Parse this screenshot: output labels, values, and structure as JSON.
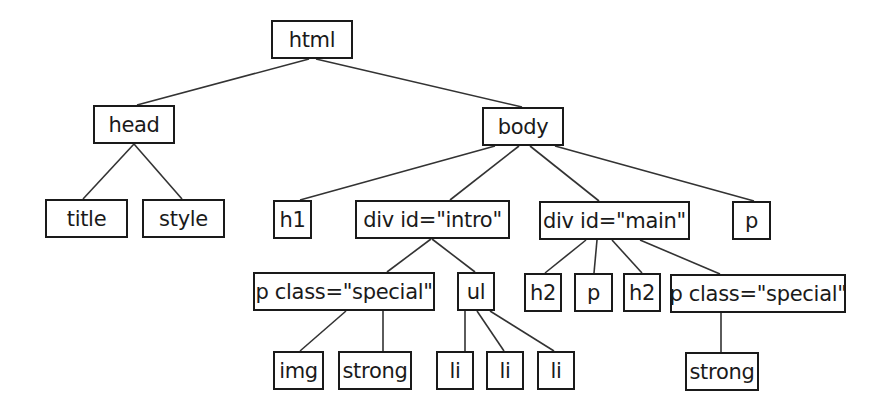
{
  "diagram": {
    "type": "dom-tree",
    "colors": {
      "box_border": "#1a1a1a",
      "edge": "#333333",
      "text": "#1a1a1a",
      "background": "#ffffff"
    },
    "nodes": [
      {
        "id": "html",
        "label": "html",
        "x": 271,
        "y": 20,
        "w": 82,
        "h": 39
      },
      {
        "id": "head",
        "label": "head",
        "x": 93,
        "y": 105,
        "w": 82,
        "h": 39
      },
      {
        "id": "body",
        "label": "body",
        "x": 482,
        "y": 107,
        "w": 82,
        "h": 39
      },
      {
        "id": "title",
        "label": "title",
        "x": 45,
        "y": 199,
        "w": 83,
        "h": 39
      },
      {
        "id": "style",
        "label": "style",
        "x": 142,
        "y": 199,
        "w": 83,
        "h": 39
      },
      {
        "id": "h1",
        "label": "h1",
        "x": 273,
        "y": 200,
        "w": 39,
        "h": 39
      },
      {
        "id": "divintro",
        "label": "div id=\"intro\"",
        "x": 355,
        "y": 200,
        "w": 155,
        "h": 39
      },
      {
        "id": "divmain",
        "label": "div id=\"main\"",
        "x": 539,
        "y": 201,
        "w": 151,
        "h": 39
      },
      {
        "id": "p_top",
        "label": "p",
        "x": 732,
        "y": 201,
        "w": 39,
        "h": 39
      },
      {
        "id": "pspecial1",
        "label": "p class=\"special\"",
        "x": 253,
        "y": 272,
        "w": 182,
        "h": 39
      },
      {
        "id": "ul",
        "label": "ul",
        "x": 457,
        "y": 272,
        "w": 38,
        "h": 39
      },
      {
        "id": "h2a",
        "label": "h2",
        "x": 524,
        "y": 273,
        "w": 38,
        "h": 39
      },
      {
        "id": "p_main",
        "label": "p",
        "x": 574,
        "y": 273,
        "w": 39,
        "h": 39
      },
      {
        "id": "h2b",
        "label": "h2",
        "x": 623,
        "y": 273,
        "w": 38,
        "h": 39
      },
      {
        "id": "pspecial2",
        "label": "p class=\"special\"",
        "x": 670,
        "y": 274,
        "w": 176,
        "h": 39
      },
      {
        "id": "img",
        "label": "img",
        "x": 273,
        "y": 351,
        "w": 51,
        "h": 39
      },
      {
        "id": "strong1",
        "label": "strong",
        "x": 338,
        "y": 351,
        "w": 74,
        "h": 39
      },
      {
        "id": "li1",
        "label": "li",
        "x": 436,
        "y": 351,
        "w": 38,
        "h": 39
      },
      {
        "id": "li2",
        "label": "li",
        "x": 486,
        "y": 351,
        "w": 38,
        "h": 39
      },
      {
        "id": "li3",
        "label": "li",
        "x": 537,
        "y": 351,
        "w": 38,
        "h": 39
      },
      {
        "id": "strong2",
        "label": "strong",
        "x": 685,
        "y": 352,
        "w": 74,
        "h": 39
      }
    ],
    "edges": [
      {
        "from": "html",
        "to": "head",
        "x1": 309,
        "y1": 59,
        "x2": 137,
        "y2": 105
      },
      {
        "from": "html",
        "to": "body",
        "x1": 316,
        "y1": 59,
        "x2": 522,
        "y2": 107
      },
      {
        "from": "head",
        "to": "title",
        "x1": 134,
        "y1": 144,
        "x2": 83,
        "y2": 199
      },
      {
        "from": "head",
        "to": "style",
        "x1": 134,
        "y1": 144,
        "x2": 182,
        "y2": 199
      },
      {
        "from": "body",
        "to": "h1",
        "x1": 495,
        "y1": 146,
        "x2": 300,
        "y2": 200
      },
      {
        "from": "body",
        "to": "divintro",
        "x1": 519,
        "y1": 146,
        "x2": 450,
        "y2": 200
      },
      {
        "from": "body",
        "to": "divmain",
        "x1": 530,
        "y1": 146,
        "x2": 599,
        "y2": 201
      },
      {
        "from": "body",
        "to": "p_top",
        "x1": 555,
        "y1": 146,
        "x2": 754,
        "y2": 201
      },
      {
        "from": "divintro",
        "to": "pspecial1",
        "x1": 431,
        "y1": 239,
        "x2": 387,
        "y2": 272
      },
      {
        "from": "divintro",
        "to": "ul",
        "x1": 432,
        "y1": 239,
        "x2": 475,
        "y2": 272
      },
      {
        "from": "pspecial1",
        "to": "img",
        "x1": 346,
        "y1": 311,
        "x2": 300,
        "y2": 351
      },
      {
        "from": "pspecial1",
        "to": "strong1",
        "x1": 383,
        "y1": 311,
        "x2": 383,
        "y2": 351
      },
      {
        "from": "ul",
        "to": "li1",
        "x1": 465,
        "y1": 311,
        "x2": 465,
        "y2": 351
      },
      {
        "from": "ul",
        "to": "li2",
        "x1": 477,
        "y1": 311,
        "x2": 504,
        "y2": 351
      },
      {
        "from": "ul",
        "to": "li3",
        "x1": 490,
        "y1": 311,
        "x2": 554,
        "y2": 351
      },
      {
        "from": "divmain",
        "to": "h2a",
        "x1": 586,
        "y1": 240,
        "x2": 545,
        "y2": 273
      },
      {
        "from": "divmain",
        "to": "p_main",
        "x1": 597,
        "y1": 240,
        "x2": 594,
        "y2": 273
      },
      {
        "from": "divmain",
        "to": "h2b",
        "x1": 612,
        "y1": 240,
        "x2": 642,
        "y2": 273
      },
      {
        "from": "divmain",
        "to": "pspecial2",
        "x1": 640,
        "y1": 240,
        "x2": 720,
        "y2": 274
      },
      {
        "from": "pspecial2",
        "to": "strong2",
        "x1": 721,
        "y1": 313,
        "x2": 721,
        "y2": 352
      }
    ]
  }
}
